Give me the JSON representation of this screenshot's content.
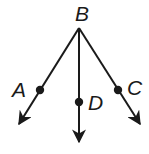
{
  "diagram": {
    "type": "rays-from-common-endpoint",
    "vertex": {
      "label": "B",
      "x": 79,
      "y": 28,
      "label_x": 76,
      "label_y": 21
    },
    "rays": [
      {
        "through": "A",
        "point": {
          "x": 40,
          "y": 90
        },
        "tip": {
          "x": 18,
          "y": 126
        },
        "label_x": 12,
        "label_y": 97
      },
      {
        "through": "D",
        "point": {
          "x": 79,
          "y": 102
        },
        "tip": {
          "x": 79,
          "y": 144
        },
        "label_x": 88,
        "label_y": 110
      },
      {
        "through": "C",
        "point": {
          "x": 118,
          "y": 90
        },
        "tip": {
          "x": 141,
          "y": 126
        },
        "label_x": 128,
        "label_y": 95
      }
    ],
    "labels": {
      "B": "B",
      "A": "A",
      "D": "D",
      "C": "C"
    },
    "colors": {
      "stroke": "#1a1a1a",
      "background": "#ffffff"
    }
  }
}
